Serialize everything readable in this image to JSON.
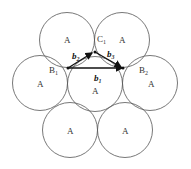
{
  "diagram": {
    "atom_label": "A",
    "circles": [
      {
        "id": "top-left",
        "label": "A"
      },
      {
        "id": "top-right",
        "label": "A"
      },
      {
        "id": "mid-left",
        "label": "A"
      },
      {
        "id": "center",
        "label": "A"
      },
      {
        "id": "mid-right",
        "label": "A"
      },
      {
        "id": "bottom-left",
        "label": "A"
      },
      {
        "id": "bottom-right",
        "label": "A"
      }
    ],
    "points": {
      "B1": {
        "base": "B",
        "sub": "1"
      },
      "B2": {
        "base": "B",
        "sub": "2"
      },
      "C1": {
        "base": "C",
        "sub": "1"
      }
    },
    "vectors": {
      "b1": {
        "base": "b",
        "sub": "1"
      },
      "b2": {
        "base": "b",
        "sub": "2"
      },
      "b3": {
        "base": "b",
        "sub": "3"
      }
    }
  }
}
